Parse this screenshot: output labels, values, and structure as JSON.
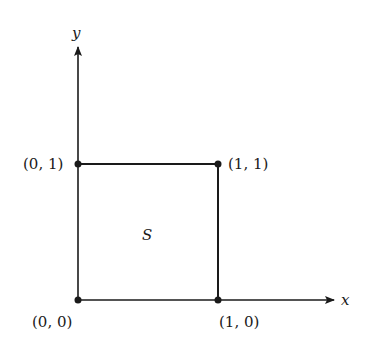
{
  "diagram": {
    "axes": {
      "x_label": "x",
      "y_label": "y"
    },
    "region_label": "S",
    "points": [
      {
        "id": "origin",
        "label": "(0, 0)"
      },
      {
        "id": "x1",
        "label": "(1, 0)"
      },
      {
        "id": "y1",
        "label": "(0, 1)"
      },
      {
        "id": "xy1",
        "label": "(1, 1)"
      }
    ],
    "colors": {
      "ink": "#1a1a1a",
      "background": "#ffffff"
    }
  }
}
